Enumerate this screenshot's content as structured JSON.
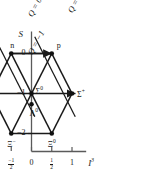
{
  "figure": {
    "kind": "su3-baryon-octet-weight-diagram",
    "axes": {
      "y_label": "S",
      "x_label": "I",
      "x_label_sub": "3",
      "y_ticks": [
        {
          "value": 0,
          "label": "0"
        },
        {
          "value": -1,
          "label": "−1"
        },
        {
          "value": -2,
          "label": "−2"
        }
      ],
      "x_ticks": [
        {
          "value": -1,
          "label": "−1",
          "is_fraction": false
        },
        {
          "value": -0.5,
          "label": "−1/2",
          "is_fraction": true,
          "sign": "−",
          "num": "1",
          "den": "2"
        },
        {
          "value": 0,
          "label": "0",
          "is_fraction": false
        },
        {
          "value": 0.5,
          "label": "1/2",
          "is_fraction": true,
          "sign": "",
          "num": "1",
          "den": "2"
        },
        {
          "value": 1,
          "label": "1",
          "is_fraction": false
        }
      ],
      "xlim": [
        -1.35,
        1.35
      ],
      "ylim": [
        -2.45,
        0.55
      ]
    },
    "charge_lines": [
      {
        "name": "q-line-0",
        "label": "Q = 0",
        "charge": 0
      },
      {
        "name": "q-line-plus1",
        "label": "Q = +1",
        "charge": 1
      },
      {
        "name": "q-line-minus1",
        "label": "Q = −1",
        "charge": -1
      }
    ],
    "particles": [
      {
        "id": "neutron",
        "label": "n",
        "sup": "",
        "i3": -0.5,
        "s": 0,
        "dot": true,
        "lbl_dx": -1,
        "lbl_dy": -12,
        "arrow": false
      },
      {
        "id": "proton",
        "label": "p",
        "sup": "",
        "i3": 0.5,
        "s": 0,
        "dot": true,
        "lbl_dx": 5,
        "lbl_dy": -12,
        "arrow": false
      },
      {
        "id": "sigma-minus",
        "label": "Σ",
        "sup": "−",
        "i3": -1,
        "s": -1,
        "dot": true,
        "lbl_dx": -15,
        "lbl_dy": 3,
        "arrow": true
      },
      {
        "id": "sigma-zero",
        "label": "Σ",
        "sup": "0",
        "i3": 0,
        "s": -1,
        "dot": true,
        "lbl_dx": 4,
        "lbl_dy": -8,
        "arrow": false
      },
      {
        "id": "sigma-plus",
        "label": "Σ",
        "sup": "+",
        "i3": 1,
        "s": -1,
        "dot": true,
        "lbl_dx": 5,
        "lbl_dy": -5,
        "arrow": true
      },
      {
        "id": "lambda-zero",
        "label": "Λ",
        "sup": "0",
        "i3": 0,
        "s": -1.27,
        "dot": true,
        "lbl_dx": -2,
        "lbl_dy": 4,
        "arrow": false
      },
      {
        "id": "xi-minus",
        "label": "Ξ",
        "sup": "−",
        "i3": -0.5,
        "s": -2,
        "dot": true,
        "lbl_dx": -4,
        "lbl_dy": 5,
        "arrow": false
      },
      {
        "id": "xi-zero",
        "label": "Ξ",
        "sup": "0",
        "i3": 0.5,
        "s": -2,
        "dot": true,
        "lbl_dx": -4,
        "lbl_dy": 5,
        "arrow": false
      }
    ],
    "colors": {
      "line": "#1a1a1a",
      "axis": "#5a5a5a",
      "background": "#ffffff",
      "vertex": "#101010"
    }
  }
}
